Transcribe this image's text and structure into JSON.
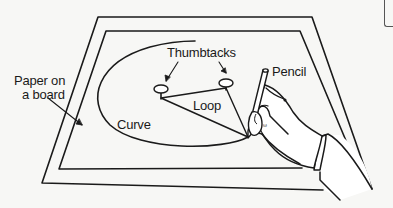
{
  "diagram": {
    "type": "illustration",
    "labels": {
      "paper": "Paper on",
      "paper_line2": "a board",
      "thumbtacks": "Thumbtacks",
      "pencil": "Pencil",
      "loop": "Loop",
      "curve": "Curve"
    },
    "colors": {
      "line": "#1a1a1a",
      "background": "#f7f7f5",
      "paper": "#ffffff"
    },
    "elements": [
      "board-outer-frame",
      "paper-inner-frame",
      "ellipse-curve",
      "thumbtack-left",
      "thumbtack-right",
      "string-loop",
      "pencil",
      "hand"
    ]
  }
}
